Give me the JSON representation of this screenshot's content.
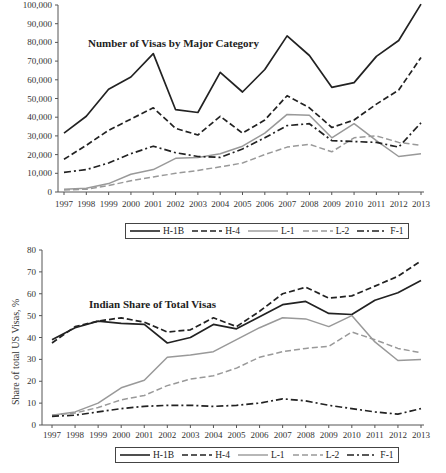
{
  "chart_data": [
    {
      "type": "line",
      "title": "Number of Visas by Major Category",
      "xlabel": "",
      "ylabel": "",
      "ylim": [
        0,
        100000
      ],
      "yticks": [
        0,
        10000,
        20000,
        30000,
        40000,
        50000,
        60000,
        70000,
        80000,
        90000,
        100000
      ],
      "ytick_labels": [
        "0",
        "10,000",
        "20,000",
        "30,000",
        "40,000",
        "50,000",
        "60,000",
        "70,000",
        "80,000",
        "90,000",
        "100,000"
      ],
      "categories": [
        "1997",
        "1998",
        "1999",
        "2000",
        "2001",
        "2002",
        "2003",
        "2004",
        "2005",
        "2006",
        "2007",
        "2008",
        "2009",
        "2010",
        "2011",
        "2012",
        "2013"
      ],
      "grid": false,
      "legend_position": "bottom",
      "series": [
        {
          "name": "H-1B",
          "style": "solid",
          "color": "#222222",
          "values": [
            31500,
            40500,
            55000,
            61500,
            74000,
            44000,
            42500,
            64000,
            53500,
            65500,
            83500,
            73000,
            56000,
            58500,
            72500,
            81000,
            100500
          ]
        },
        {
          "name": "H-4",
          "style": "dashed",
          "color": "#222222",
          "values": [
            17500,
            25000,
            33000,
            39000,
            45000,
            34000,
            30500,
            40500,
            31500,
            38500,
            51500,
            45000,
            34500,
            38500,
            47000,
            54500,
            72000
          ]
        },
        {
          "name": "L-1",
          "style": "solid",
          "color": "#999999",
          "values": [
            1500,
            2000,
            4500,
            9500,
            12000,
            18000,
            18500,
            20500,
            24500,
            31500,
            41500,
            41000,
            29000,
            36500,
            27500,
            19000,
            20500
          ]
        },
        {
          "name": "L-2",
          "style": "dashed",
          "color": "#999999",
          "values": [
            1000,
            1500,
            3500,
            6000,
            8000,
            10000,
            11500,
            13500,
            15500,
            20000,
            24000,
            25500,
            21500,
            29000,
            30000,
            26500,
            25000
          ]
        },
        {
          "name": "F-1",
          "style": "dashdot",
          "color": "#222222",
          "values": [
            10500,
            12000,
            15500,
            20500,
            24500,
            21000,
            19000,
            18500,
            23000,
            29000,
            35500,
            36500,
            27500,
            27000,
            26500,
            24000,
            37000
          ]
        }
      ]
    },
    {
      "type": "line",
      "title": "Indian Share of Total Visas",
      "xlabel": "",
      "ylabel": "Share of total US Visas, %",
      "ylim": [
        0,
        80
      ],
      "yticks": [
        0,
        10,
        20,
        30,
        40,
        50,
        60,
        70,
        80
      ],
      "ytick_labels": [
        "0",
        "10",
        "20",
        "30",
        "40",
        "50",
        "60",
        "70",
        "80"
      ],
      "categories": [
        "1997",
        "1998",
        "1999",
        "2000",
        "2001",
        "2002",
        "2003",
        "2004",
        "2005",
        "2006",
        "2007",
        "2008",
        "2009",
        "2010",
        "2011",
        "2012",
        "2013"
      ],
      "grid": false,
      "legend_position": "bottom",
      "series": [
        {
          "name": "H-1B",
          "style": "solid",
          "color": "#222222",
          "values": [
            39,
            44.5,
            47.5,
            46.5,
            46,
            37.5,
            40,
            46,
            44,
            49.5,
            55,
            56.5,
            51,
            50.5,
            57,
            60.5,
            66
          ]
        },
        {
          "name": "H-4",
          "style": "dashed",
          "color": "#222222",
          "values": [
            37.5,
            45,
            47.5,
            49,
            47,
            42.5,
            43.5,
            49,
            45,
            52,
            60,
            63,
            58,
            59,
            63.5,
            68,
            75
          ]
        },
        {
          "name": "L-1",
          "style": "solid",
          "color": "#999999",
          "values": [
            4.5,
            6,
            10,
            17,
            20.5,
            31,
            32,
            33.5,
            39,
            44.5,
            49,
            48.5,
            45,
            50,
            38,
            29.5,
            30
          ]
        },
        {
          "name": "L-2",
          "style": "dashed",
          "color": "#999999",
          "values": [
            4.5,
            5.5,
            8,
            11.5,
            13.5,
            18,
            21,
            22.5,
            26,
            31,
            33.5,
            35,
            36,
            42.5,
            39,
            35,
            33
          ]
        },
        {
          "name": "F-1",
          "style": "dashdot",
          "color": "#222222",
          "values": [
            4,
            4.5,
            6,
            7.5,
            8.5,
            9,
            9,
            8.5,
            9,
            10,
            12,
            11,
            9,
            7.5,
            6,
            5,
            7.5
          ]
        }
      ]
    }
  ],
  "legend": {
    "items": [
      {
        "label": "H-1B"
      },
      {
        "label": "H-4"
      },
      {
        "label": "L-1"
      },
      {
        "label": "L-2"
      },
      {
        "label": "F-1"
      }
    ]
  }
}
